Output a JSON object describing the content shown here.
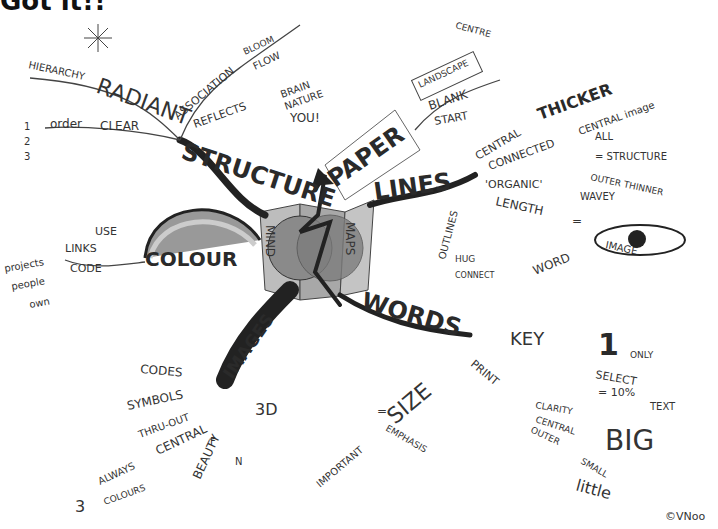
{
  "header": {
    "text": "Got it!!"
  },
  "center": {
    "left_label": "MIND",
    "right_label": "MAPS"
  },
  "branches": {
    "structure": {
      "label": "STRUCTURE",
      "sub": [
        "RADIANT",
        "HIERARCHY",
        "order",
        "CLEAR",
        "1",
        "2",
        "3",
        "ASSOCIATION",
        "BLOOM",
        "FLOW",
        "REFLECTS",
        "BRAIN",
        "NATURE",
        "YOU!"
      ]
    },
    "paper": {
      "label": "PAPER",
      "sub": [
        "LANDSCAPE",
        "BLANK",
        "START",
        "CENTRE"
      ]
    },
    "lines": {
      "label": "LINES",
      "sub": [
        "CENTRAL",
        "THICKER",
        "CONNECTED",
        "CENTRAL image",
        "ALL",
        "= STRUCTURE",
        "OUTER THINNER",
        "'ORGANIC'",
        "WAVEY",
        "LENGTH",
        "=",
        "IMAGE",
        "WORD",
        "OUTLINES",
        "HUG",
        "CONNECT"
      ]
    },
    "colour": {
      "label": "COLOUR",
      "sub": [
        "USE",
        "LINKS",
        "CODE",
        "projects",
        "people",
        "own"
      ]
    },
    "images": {
      "label": "IMAGES",
      "sub": [
        "CODES",
        "SYMBOLS",
        "THRU-OUT",
        "CENTRAL",
        "ALWAYS",
        "COLOURS",
        "3",
        "BEAUTY",
        "F",
        "N",
        "3D"
      ]
    },
    "words": {
      "label": "WORDS",
      "sub": [
        "KEY",
        "1",
        "ONLY",
        "SELECT",
        "= 10%",
        "TEXT",
        "PRINT",
        "CLARITY",
        "CENTRAL",
        "BIG",
        "OUTER",
        "SMALL",
        "little",
        "SIZE",
        "=",
        "IMPORTANT",
        "EMPHASIS"
      ]
    }
  },
  "signature": "©VNoo"
}
